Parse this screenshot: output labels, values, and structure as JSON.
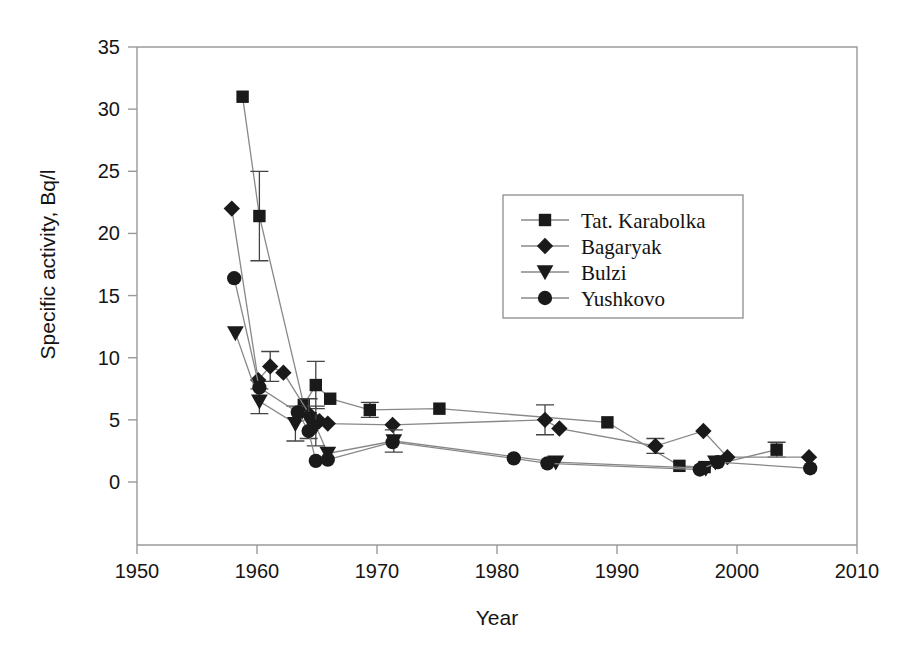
{
  "chart_data": {
    "type": "scatter",
    "title": "",
    "subtitle": "",
    "xlabel": "Year",
    "ylabel": "Specific activity, Bq/l",
    "xlim": [
      1950,
      2010
    ],
    "ylim": [
      0,
      35
    ],
    "xticks": [
      1950,
      1960,
      1970,
      1980,
      1990,
      2000,
      2010
    ],
    "yticks": [
      0,
      5,
      10,
      15,
      20,
      25,
      30,
      35
    ],
    "grid": false,
    "legend_position": "upper-center-right",
    "line_color": "#888888",
    "marker_color": "#1a1a1a",
    "frame_color": "#9a9a9a",
    "series": [
      {
        "name": "Tat. Karabolka",
        "marker": "square",
        "points": [
          {
            "x": 1958.8,
            "y": 31.0,
            "err": 0
          },
          {
            "x": 1960.2,
            "y": 21.4,
            "err": 3.6
          },
          {
            "x": 1963.9,
            "y": 6.2,
            "err": 0
          },
          {
            "x": 1964.9,
            "y": 7.8,
            "err": 1.9
          },
          {
            "x": 1966.1,
            "y": 6.7,
            "err": 0
          },
          {
            "x": 1969.4,
            "y": 5.8,
            "err": 0.6
          },
          {
            "x": 1975.2,
            "y": 5.9,
            "err": 0
          },
          {
            "x": 1989.2,
            "y": 4.8,
            "err": 0
          },
          {
            "x": 1995.2,
            "y": 1.3,
            "err": 0
          },
          {
            "x": 1997.3,
            "y": 1.2,
            "err": 0
          },
          {
            "x": 2003.3,
            "y": 2.6,
            "err": 0.6
          }
        ]
      },
      {
        "name": "Bagaryak",
        "marker": "diamond",
        "points": [
          {
            "x": 1957.9,
            "y": 22.0,
            "err": 0
          },
          {
            "x": 1960.1,
            "y": 8.2,
            "err": 0
          },
          {
            "x": 1961.1,
            "y": 9.3,
            "err": 1.2
          },
          {
            "x": 1962.2,
            "y": 8.8,
            "err": 0
          },
          {
            "x": 1964.4,
            "y": 5.4,
            "err": 0
          },
          {
            "x": 1965.2,
            "y": 4.9,
            "err": 0
          },
          {
            "x": 1965.9,
            "y": 4.7,
            "err": 0
          },
          {
            "x": 1971.3,
            "y": 4.6,
            "err": 0
          },
          {
            "x": 1984.0,
            "y": 5.0,
            "err": 1.2
          },
          {
            "x": 1985.2,
            "y": 4.3,
            "err": 0
          },
          {
            "x": 1993.2,
            "y": 2.9,
            "err": 0.6
          },
          {
            "x": 1997.2,
            "y": 4.1,
            "err": 0
          },
          {
            "x": 1999.2,
            "y": 2.0,
            "err": 0
          },
          {
            "x": 2006.0,
            "y": 2.0,
            "err": 0
          }
        ]
      },
      {
        "name": "Bulzi",
        "marker": "triangle-down",
        "points": [
          {
            "x": 1958.2,
            "y": 12.0,
            "err": 0
          },
          {
            "x": 1960.2,
            "y": 6.5,
            "err": 1.0
          },
          {
            "x": 1963.2,
            "y": 4.7,
            "err": 1.4
          },
          {
            "x": 1964.3,
            "y": 5.1,
            "err": 1.6
          },
          {
            "x": 1964.9,
            "y": 4.5,
            "err": 1.6
          },
          {
            "x": 1965.9,
            "y": 2.3,
            "err": 0
          },
          {
            "x": 1971.4,
            "y": 3.3,
            "err": 0.9
          },
          {
            "x": 1984.9,
            "y": 1.6,
            "err": 0
          },
          {
            "x": 1997.4,
            "y": 1.1,
            "err": 0
          },
          {
            "x": 1998.2,
            "y": 1.6,
            "err": 0
          }
        ]
      },
      {
        "name": "Yushkovo",
        "marker": "circle",
        "points": [
          {
            "x": 1958.1,
            "y": 16.4,
            "err": 0
          },
          {
            "x": 1960.2,
            "y": 7.6,
            "err": 0
          },
          {
            "x": 1963.4,
            "y": 5.6,
            "err": 0
          },
          {
            "x": 1964.3,
            "y": 4.1,
            "err": 0
          },
          {
            "x": 1964.9,
            "y": 1.7,
            "err": 0
          },
          {
            "x": 1965.9,
            "y": 1.8,
            "err": 0
          },
          {
            "x": 1971.3,
            "y": 3.2,
            "err": 0
          },
          {
            "x": 1981.4,
            "y": 1.9,
            "err": 0
          },
          {
            "x": 1984.2,
            "y": 1.5,
            "err": 0
          },
          {
            "x": 1996.9,
            "y": 1.0,
            "err": 0
          },
          {
            "x": 1998.4,
            "y": 1.6,
            "err": 0
          },
          {
            "x": 2006.1,
            "y": 1.1,
            "err": 0
          }
        ]
      }
    ]
  },
  "legend": {
    "entries": [
      {
        "label": "Tat. Karabolka",
        "marker": "square"
      },
      {
        "label": "Bagaryak",
        "marker": "diamond"
      },
      {
        "label": "Bulzi",
        "marker": "triangle-down"
      },
      {
        "label": "Yushkovo",
        "marker": "circle"
      }
    ]
  },
  "axes": {
    "x_tick_labels": [
      "1950",
      "1960",
      "1970",
      "1980",
      "1990",
      "2000",
      "2010"
    ],
    "y_tick_labels": [
      "0",
      "5",
      "10",
      "15",
      "20",
      "25",
      "30",
      "35"
    ],
    "x_title": "Year",
    "y_title": "Specific activity, Bq/l"
  }
}
